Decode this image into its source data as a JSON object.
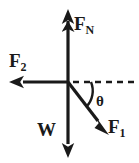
{
  "figure": {
    "background_color": "#ffffff",
    "stroke_color": "#1a1a1a",
    "origin": {
      "x": 68,
      "y": 82
    },
    "labels": {
      "normal_force": {
        "base": "F",
        "sub": "N"
      },
      "force_two": {
        "base": "F",
        "sub": "2"
      },
      "weight": {
        "base": "W",
        "sub": ""
      },
      "force_one": {
        "base": "F",
        "sub": "1"
      },
      "angle": "θ"
    },
    "vectors": [
      {
        "name": "normal-force",
        "label": "F_N",
        "direction": "up",
        "from": {
          "x": 68,
          "y": 82
        },
        "to": {
          "x": 68,
          "y": 10
        },
        "style": "solid"
      },
      {
        "name": "force-two",
        "label": "F_2",
        "direction": "left",
        "from": {
          "x": 68,
          "y": 82
        },
        "to": {
          "x": 10,
          "y": 82
        },
        "style": "solid"
      },
      {
        "name": "weight",
        "label": "W",
        "direction": "down",
        "from": {
          "x": 68,
          "y": 82
        },
        "to": {
          "x": 68,
          "y": 157
        },
        "style": "solid"
      },
      {
        "name": "force-one",
        "label": "F_1",
        "direction": "down-right",
        "from": {
          "x": 68,
          "y": 82
        },
        "to": {
          "x": 107,
          "y": 133
        },
        "style": "solid"
      }
    ],
    "reference_line": {
      "name": "horizontal-dashed-reference",
      "from": {
        "x": 73,
        "y": 82
      },
      "to": {
        "x": 136,
        "y": 82
      },
      "style": "dashed"
    },
    "angle_arc": {
      "name": "theta-arc",
      "between": [
        "force-one",
        "horizontal-dashed-reference"
      ],
      "radius": 23
    }
  }
}
